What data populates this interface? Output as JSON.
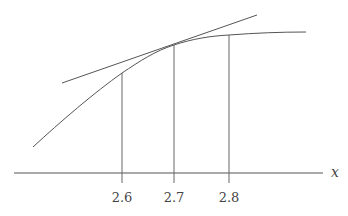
{
  "diagram": {
    "axis_label": "x",
    "ticks": [
      {
        "label": "2.6",
        "x": 122
      },
      {
        "label": "2.7",
        "x": 174
      },
      {
        "label": "2.8",
        "x": 229
      }
    ],
    "colors": {
      "line": "#555555",
      "text": "#444444",
      "background": "#ffffff"
    },
    "elements": [
      "curve",
      "tangent-line at x=2.7",
      "vertical guide lines at 2.6, 2.7, 2.8",
      "x-axis"
    ]
  }
}
